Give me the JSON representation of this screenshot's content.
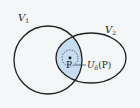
{
  "diagram": {
    "type": "set-neighborhood",
    "background": "#f3f7f7",
    "fill_color": "#c6dcf0",
    "stroke_color": "#1e1e1e",
    "sets": [
      {
        "name": "V1",
        "label_main": "V",
        "label_sub": "1",
        "shape": "circle",
        "cx": 48,
        "cy": 60,
        "r": 34
      },
      {
        "name": "V2",
        "label_main": "V",
        "label_sub": "2",
        "shape": "ellipse",
        "cx": 91,
        "cy": 58,
        "rx": 35,
        "ry": 25
      }
    ],
    "point": {
      "label": "P",
      "x": 70,
      "y": 58
    },
    "neighborhood": {
      "label_main": "U",
      "label_sub": "δ",
      "label_arg": "(P)",
      "radius": 8
    }
  }
}
